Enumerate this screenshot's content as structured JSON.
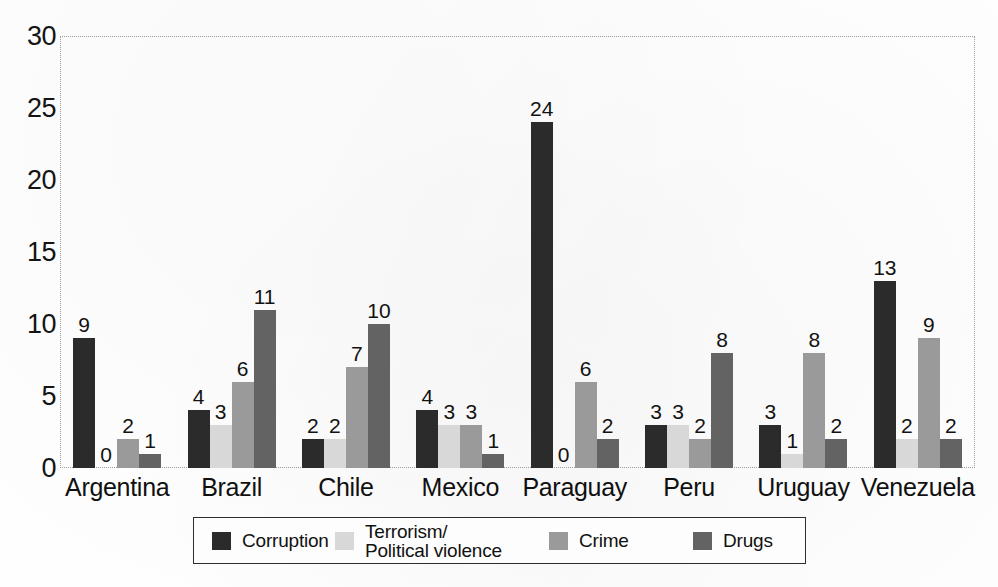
{
  "chart_data": {
    "type": "bar",
    "title": "",
    "xlabel": "",
    "ylabel": "",
    "ylim": [
      0,
      30
    ],
    "yticks": [
      0,
      5,
      10,
      15,
      20,
      25,
      30
    ],
    "grid": false,
    "legend_position": "bottom",
    "categories": [
      "Argentina",
      "Brazil",
      "Chile",
      "Mexico",
      "Paraguay",
      "Peru",
      "Uruguay",
      "Venezuela"
    ],
    "series": [
      {
        "name": "Corruption",
        "color": "#2b2b2b",
        "values": [
          9,
          4,
          2,
          4,
          24,
          3,
          3,
          13
        ]
      },
      {
        "name": "Terrorism/\nPolitical violence",
        "color": "#d8d8d8",
        "values": [
          0,
          3,
          2,
          3,
          0,
          3,
          1,
          2
        ]
      },
      {
        "name": "Crime",
        "color": "#9a9a9a",
        "values": [
          2,
          6,
          7,
          3,
          6,
          2,
          8,
          9
        ]
      },
      {
        "name": "Drugs",
        "color": "#636363",
        "values": [
          1,
          11,
          10,
          1,
          2,
          8,
          2,
          2
        ]
      }
    ]
  }
}
